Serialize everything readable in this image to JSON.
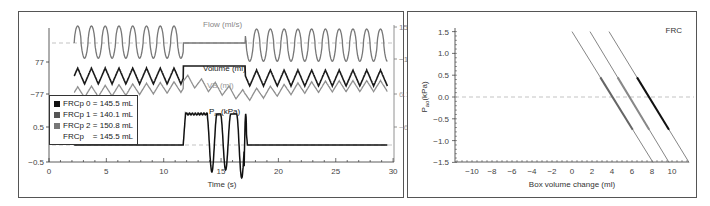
{
  "chart_data": [
    {
      "type": "line",
      "title": "",
      "xlabel": "Time (s)",
      "xlim": [
        0,
        30
      ],
      "x_ticks": [
        0,
        5,
        10,
        15,
        20,
        25,
        30
      ],
      "left_axis_ticks": [
        "77",
        "-77",
        "0.5",
        "-0.5"
      ],
      "right_axis_ticks": [
        "150",
        "-150",
        "6.1",
        "-6.1"
      ],
      "annotations": {
        "occlusion_start_s": 11.7,
        "occlusion_end_s": 17.1
      },
      "series": [
        {
          "name": "Flow (ml/s)",
          "color": "#777777",
          "range": [
            -150,
            150
          ],
          "description": "oscillating ~1.2 s period from 2.2 s to 11.7 s, flat zero during occlusion 11.7–17.1 s, oscillating to 29.5 s"
        },
        {
          "name": "Volume (ml)",
          "color": "#1a1a1a",
          "range": [
            -77,
            77
          ],
          "description": "triangular oscillation, plateau during occlusion"
        },
        {
          "name": "VB (ml)",
          "color": "#8a8a8a",
          "range": [
            -6.1,
            6.1
          ],
          "description": "box volume, oscillating, continues during occlusion with drift"
        },
        {
          "name": "Pao (kPa)",
          "color": "#111111",
          "range": [
            -0.5,
            0.5
          ],
          "description": "zero until 11.7 s, rises to ~0.8 plateau, three large negative swings ~14.2, 15.4, 16.8 s, spike at 17.1 s then zero"
        }
      ]
    },
    {
      "type": "scatter",
      "title": "FRC",
      "xlabel": "Box volume change (ml)",
      "ylabel": "Pao (kPa)",
      "xlim": [
        -11.7,
        11.7
      ],
      "ylim": [
        -1.5,
        1.5
      ],
      "x_ticks": [
        -10,
        -8,
        -6,
        -4,
        -2,
        0,
        2,
        4,
        6,
        8,
        10
      ],
      "y_ticks": [
        1.5,
        1.0,
        0.5,
        0.0,
        -0.5,
        -1.0,
        -1.5
      ],
      "series": [
        {
          "name": "FRCp 0 = 145.5 mL",
          "color": "#111111",
          "x": [
            3.7,
            11.7
          ],
          "y": [
            1.5,
            -1.5
          ]
        },
        {
          "name": "FRCp 1 = 140.1 mL",
          "color": "#666666",
          "x": [
            0.0,
            8.1
          ],
          "y": [
            1.5,
            -1.5
          ]
        },
        {
          "name": "FRCp 2 = 150.8 mL",
          "color": "#888888",
          "x": [
            1.8,
            9.7
          ],
          "y": [
            1.5,
            -1.5
          ]
        }
      ],
      "legend": [
        "FRCp 0 = 145.5 mL",
        "FRCp 1 = 140.1 mL",
        "FRCp 2 = 150.8 mL",
        "FRCp    = 145.5 mL"
      ],
      "legend_position": "left-center"
    }
  ],
  "left": {
    "labels": {
      "flow": "Flow (ml/s)",
      "volume": "Volume (ml)",
      "vb": "VB (ml)",
      "pao_main": "P",
      "pao_sub": "ao",
      "pao_unit": "(kPa)",
      "xlabel": "Time (s)"
    },
    "left_ticks": [
      "77",
      "−77",
      "0.5",
      "−0.5"
    ],
    "right_ticks": [
      "150",
      "−150",
      "6.1",
      "−6.1"
    ],
    "x_ticks": [
      "0",
      "5",
      "10",
      "15",
      "20",
      "25",
      "30"
    ]
  },
  "right": {
    "title": "FRC",
    "xlabel": "Box volume change (ml)",
    "ylabel_main": "P",
    "ylabel_sub": "ao",
    "ylabel_unit": "(kPa)",
    "y_ticks": [
      "1.5",
      "1.0",
      "0.5",
      "0.0",
      "−0.5",
      "−1.0",
      "−1.5"
    ],
    "x_ticks": [
      "−10",
      "−8",
      "−6",
      "−4",
      "−2",
      "0",
      "2",
      "4",
      "6",
      "8",
      "10"
    ],
    "legend": [
      {
        "label": "FRCp 0 = 145.5 mL",
        "color": "#111111"
      },
      {
        "label": "FRCp 1 = 140.1 mL",
        "color": "#555555"
      },
      {
        "label": "FRCp 2 = 150.8 mL",
        "color": "#777777"
      },
      {
        "label": "FRCp    = 145.5 mL",
        "color": ""
      }
    ]
  }
}
